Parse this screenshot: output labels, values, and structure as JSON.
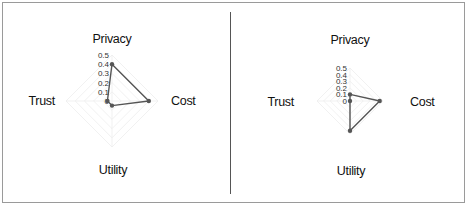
{
  "chart_data": [
    {
      "type": "radar",
      "title": "",
      "axes": [
        "Privacy",
        "Cost",
        "Utility",
        "Trust"
      ],
      "tick_labels": [
        "0.5",
        "0.4",
        "0.3",
        "0.2",
        "0.1",
        "0"
      ],
      "range": [
        0,
        0.5
      ],
      "grid": true,
      "series": [
        {
          "name": "",
          "values": [
            0.4,
            0.4,
            0.05,
            0.05
          ]
        }
      ],
      "layout": {
        "cx": 112,
        "cy": 101,
        "r": 46
      }
    },
    {
      "type": "radar",
      "title": "",
      "axes": [
        "Privacy",
        "Cost",
        "Utility",
        "Trust"
      ],
      "tick_labels": [
        "0.5",
        "0.4",
        "0.3",
        "0.2",
        "0.1",
        "0"
      ],
      "range": [
        0,
        0.5
      ],
      "grid": true,
      "series": [
        {
          "name": "",
          "values": [
            0.1,
            0.45,
            0.45,
            0.0
          ]
        }
      ],
      "layout": {
        "cx": 350,
        "cy": 101,
        "r": 33
      }
    }
  ],
  "colors": {
    "series_line": "#555555",
    "grid": "#eeeeee",
    "frame": "#9a9a9a",
    "divider": "#555555"
  }
}
